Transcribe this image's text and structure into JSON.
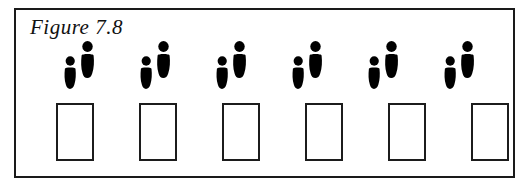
{
  "figure": {
    "caption": "Figure 7.8",
    "border_color": "#1a1a1a",
    "background_color": "#ffffff",
    "ink_color": "#000000"
  },
  "footprints": {
    "count": 6,
    "icon_name": "footprint-pair-icon",
    "description": "pair of black shoe prints, small left foot and taller right foot, each with separate toe pad and sole",
    "items": [
      {
        "label": "footprint-pair-1",
        "left": 42
      },
      {
        "label": "footprint-pair-2",
        "left": 118
      },
      {
        "label": "footprint-pair-3",
        "left": 194
      },
      {
        "label": "footprint-pair-4",
        "left": 270
      },
      {
        "label": "footprint-pair-5",
        "left": 346
      },
      {
        "label": "footprint-pair-6",
        "left": 422
      }
    ]
  },
  "boxes": {
    "count": 6,
    "shape": "rectangle",
    "fill": "#ffffff",
    "stroke": "#1c1c1c",
    "items": [
      {
        "label": "box-1",
        "left": 40
      },
      {
        "label": "box-2",
        "left": 123
      },
      {
        "label": "box-3",
        "left": 206
      },
      {
        "label": "box-4",
        "left": 289
      },
      {
        "label": "box-5",
        "left": 372
      },
      {
        "label": "box-6",
        "left": 455
      }
    ]
  }
}
